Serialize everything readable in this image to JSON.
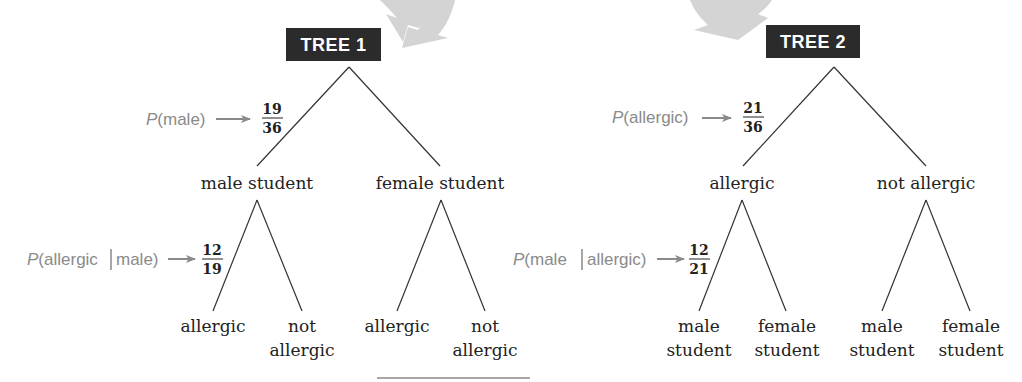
{
  "colors": {
    "title_box": "#2b2b2b",
    "title_text": "#ffffff",
    "annotation": "#8a8a8a",
    "branch": "#333333",
    "big_arrow": "#d4d4d4"
  },
  "tree1": {
    "title": "TREE 1",
    "level1": {
      "left": "male student",
      "right": "female student"
    },
    "level2": {
      "left_left": "allergic",
      "left_right_line1": "not",
      "left_right_line2": "allergic",
      "right_left": "allergic",
      "right_right_line1": "not",
      "right_right_line2": "allergic"
    },
    "annotation1": {
      "label_prefix": "P",
      "label_rest": "(male)",
      "numerator": "19",
      "denominator": "36"
    },
    "annotation2": {
      "label_prefix": "P",
      "label_rest_a": "(allergic",
      "label_rest_b": "male)",
      "numerator": "12",
      "denominator": "19"
    }
  },
  "tree2": {
    "title": "TREE 2",
    "level1": {
      "left": "allergic",
      "right": "not allergic"
    },
    "level2": {
      "left_left_line1": "male",
      "left_left_line2": "student",
      "left_right_line1": "female",
      "left_right_line2": "student",
      "right_left_line1": "male",
      "right_left_line2": "student",
      "right_right_line1": "female",
      "right_right_line2": "student"
    },
    "annotation1": {
      "label_prefix": "P",
      "label_rest": "(allergic)",
      "numerator": "21",
      "denominator": "36"
    },
    "annotation2": {
      "label_prefix": "P",
      "label_rest_a": "(male",
      "label_rest_b": "allergic)",
      "numerator": "12",
      "denominator": "21"
    }
  }
}
